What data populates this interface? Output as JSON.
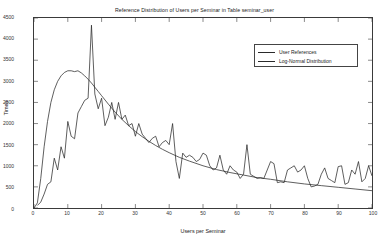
{
  "chart_data": {
    "type": "line",
    "title": "Reference Distribution of Users per Seminar in Table seminar_user",
    "xlabel": "Users per Seminar",
    "ylabel": "Times",
    "xlim": [
      0,
      100
    ],
    "ylim": [
      0,
      4500
    ],
    "grid": false,
    "legend_position": "top-right",
    "xticks": [
      0,
      10,
      20,
      30,
      40,
      50,
      60,
      70,
      80,
      90,
      100
    ],
    "yticks": [
      0,
      500,
      1000,
      1500,
      2000,
      2500,
      3000,
      3500,
      4000,
      4500
    ],
    "series": [
      {
        "name": "User References",
        "color": "#2a2a2a",
        "x": [
          1,
          2,
          3,
          4,
          5,
          6,
          7,
          8,
          9,
          10,
          11,
          12,
          13,
          14,
          15,
          16,
          17,
          18,
          19,
          20,
          21,
          22,
          23,
          24,
          25,
          26,
          27,
          28,
          29,
          30,
          31,
          32,
          33,
          34,
          35,
          36,
          37,
          38,
          39,
          40,
          41,
          42,
          43,
          44,
          45,
          46,
          47,
          48,
          49,
          50,
          51,
          52,
          53,
          54,
          55,
          56,
          57,
          58,
          59,
          60,
          61,
          62,
          63,
          64,
          65,
          66,
          67,
          68,
          69,
          70,
          71,
          72,
          73,
          74,
          75,
          76,
          77,
          78,
          79,
          80,
          81,
          82,
          83,
          84,
          85,
          86,
          87,
          88,
          89,
          90,
          91,
          92,
          93,
          94,
          95,
          96,
          97,
          98,
          99,
          100
        ],
        "values": [
          60,
          140,
          330,
          560,
          620,
          1180,
          900,
          1450,
          1180,
          2050,
          1700,
          1640,
          2250,
          2400,
          2550,
          2600,
          4330,
          2700,
          2350,
          2600,
          1950,
          2150,
          2500,
          2100,
          2500,
          2100,
          2200,
          1950,
          2000,
          1700,
          2000,
          1750,
          1650,
          1550,
          1650,
          1700,
          1450,
          1550,
          1600,
          1500,
          2000,
          1100,
          700,
          1300,
          1200,
          1250,
          1200,
          1100,
          1150,
          1300,
          1250,
          1000,
          900,
          950,
          1250,
          900,
          800,
          1000,
          900,
          850,
          700,
          800,
          1500,
          800,
          750,
          700,
          720,
          700,
          900,
          1100,
          1050,
          600,
          620,
          600,
          900,
          950,
          1000,
          850,
          900,
          1000,
          700,
          500,
          520,
          560,
          800,
          950,
          700,
          650,
          600,
          980,
          1000,
          560,
          600,
          900,
          800,
          1100,
          620,
          700,
          1000,
          760
        ]
      },
      {
        "name": "Log-Normal Distribution",
        "color": "#2a2a2a",
        "x": [
          0,
          1,
          2,
          3,
          4,
          5,
          6,
          7,
          8,
          9,
          10,
          11,
          12,
          13,
          14,
          15,
          16,
          17,
          18,
          19,
          20,
          22,
          24,
          26,
          28,
          30,
          32,
          34,
          36,
          38,
          40,
          43,
          46,
          50,
          54,
          58,
          62,
          66,
          70,
          75,
          80,
          85,
          90,
          95,
          100
        ],
        "values": [
          0,
          120,
          700,
          1450,
          2050,
          2500,
          2800,
          3000,
          3130,
          3210,
          3250,
          3250,
          3230,
          3250,
          3200,
          3130,
          3050,
          2960,
          2860,
          2760,
          2660,
          2460,
          2270,
          2100,
          1950,
          1810,
          1690,
          1580,
          1480,
          1390,
          1310,
          1200,
          1110,
          1000,
          910,
          840,
          780,
          720,
          680,
          620,
          570,
          530,
          490,
          450,
          410
        ]
      }
    ]
  },
  "axes": {
    "ytick_labels": [
      "4500",
      "4000",
      "3500",
      "3000",
      "2500",
      "2000",
      "1500",
      "1000",
      "500",
      "0"
    ],
    "xtick_labels": [
      "0",
      "10",
      "20",
      "30",
      "40",
      "50",
      "60",
      "70",
      "80",
      "90",
      "100"
    ]
  }
}
